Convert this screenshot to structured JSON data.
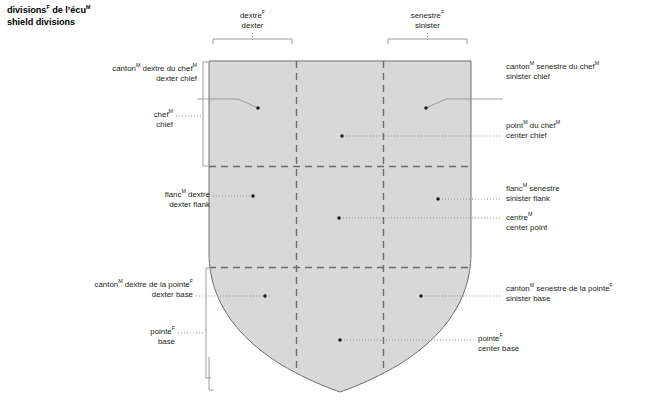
{
  "title": {
    "line1_pre": "divisions",
    "line1_sup1": "F",
    "line1_mid": " de l’écu",
    "line1_sup2": "M",
    "line2": "shield divisions"
  },
  "top_labels": [
    {
      "name": "dexter",
      "fr_pre": "dextre",
      "fr_sup": "F",
      "fr_post": "",
      "en": "dexter"
    },
    {
      "name": "sinister",
      "fr_pre": "senestre",
      "fr_sup": "F",
      "fr_post": "",
      "en": "sinister"
    }
  ],
  "left_labels": [
    {
      "name": "dexter-chief",
      "fr_pre": "canton",
      "fr_sup": "M",
      "fr_post": " dextre du chef",
      "fr_sup2": "M",
      "en": "dexter chief"
    },
    {
      "name": "chief",
      "fr_pre": "chef",
      "fr_sup": "M",
      "fr_post": "",
      "en": "chief"
    },
    {
      "name": "dexter-flank",
      "fr_pre": "flanc",
      "fr_sup": "M",
      "fr_post": " dextre",
      "en": "dexter flank"
    },
    {
      "name": "dexter-base",
      "fr_pre": "canton",
      "fr_sup": "M",
      "fr_post": " dextre de la pointe",
      "fr_sup2": "F",
      "en": "dexter base"
    },
    {
      "name": "base",
      "fr_pre": "pointe",
      "fr_sup": "F",
      "fr_post": "",
      "en": "base"
    }
  ],
  "right_labels": [
    {
      "name": "sinister-chief",
      "fr_pre": "canton",
      "fr_sup": "M",
      "fr_post": " senestre du chef",
      "fr_sup2": "M",
      "en": "sinister chief"
    },
    {
      "name": "center-chief",
      "fr_pre": "point",
      "fr_sup": "M",
      "fr_post": " du chef",
      "fr_sup2": "M",
      "en": "center chief"
    },
    {
      "name": "sinister-flank",
      "fr_pre": "flanc",
      "fr_sup": "M",
      "fr_post": " senestre",
      "en": "sinister flank"
    },
    {
      "name": "center-point",
      "fr_pre": "centre",
      "fr_sup": "M",
      "fr_post": "",
      "en": "center point"
    },
    {
      "name": "sinister-base",
      "fr_pre": "canton",
      "fr_sup": "M",
      "fr_post": " senestre de la pointe",
      "fr_sup2": "F",
      "en": "sinister base"
    },
    {
      "name": "center-base",
      "fr_pre": "pointe",
      "fr_sup": "F",
      "fr_post": "",
      "en": "center base"
    }
  ],
  "colors": {
    "shield_fill": "#d8d8d8",
    "shield_stroke": "#6e6e6e",
    "divider": "#6b6b6b",
    "leader": "#8a8a8a",
    "bracket": "#9a9a9a",
    "text": "#231f20",
    "title_text": "#000000",
    "background": "#ffffff"
  }
}
